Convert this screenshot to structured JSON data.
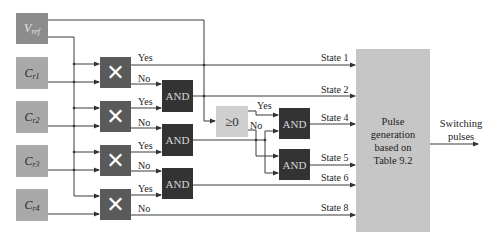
{
  "inputs": {
    "vref": {
      "base": "V",
      "sub": "ref"
    },
    "cr": [
      {
        "base": "C",
        "sub": "r1"
      },
      {
        "base": "C",
        "sub": "r2"
      },
      {
        "base": "C",
        "sub": "r3"
      },
      {
        "base": "C",
        "sub": "r4"
      }
    ]
  },
  "multipliers": [
    {
      "symbol": "✕",
      "yes": "Yes",
      "no": "No"
    },
    {
      "symbol": "✕",
      "yes": "Yes",
      "no": "No"
    },
    {
      "symbol": "✕",
      "yes": "Yes",
      "no": "No"
    },
    {
      "symbol": "✕",
      "yes": "Yes",
      "no": "No"
    }
  ],
  "and_gates": [
    "AND",
    "AND",
    "AND",
    "AND",
    "AND"
  ],
  "comparator": {
    "label": "≥0",
    "yes": "Yes",
    "no": "No"
  },
  "states": [
    "State 1",
    "State 2",
    "State 4",
    "State 5",
    "State 6",
    "State 8"
  ],
  "pulse_block": {
    "line1": "Pulse",
    "line2": "generation",
    "line3": "based on",
    "line4": "Table 9.2"
  },
  "output": {
    "line1": "Switching",
    "line2": "pulses"
  },
  "colors": {
    "vref_box": "#8c8c8c",
    "cr_box": "#a9a9a9",
    "multiplier_box": "#5a5a5a",
    "and_box": "#333333",
    "comparator_box": "#cfcfcf",
    "pulse_box": "#c6c6c6",
    "wire": "#333333"
  }
}
